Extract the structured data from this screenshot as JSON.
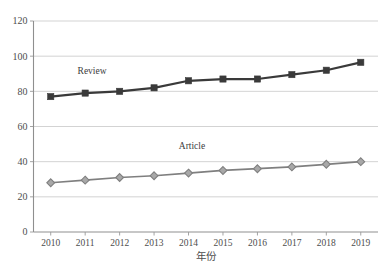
{
  "chart_data": {
    "type": "line",
    "title": "",
    "xlabel": "年份",
    "ylabel": "",
    "categories": [
      "2010",
      "2011",
      "2012",
      "2013",
      "2014",
      "2015",
      "2016",
      "2017",
      "2018",
      "2019"
    ],
    "x": [
      2010,
      2011,
      2012,
      2013,
      2014,
      2015,
      2016,
      2017,
      2018,
      2019
    ],
    "ylim": [
      0,
      120
    ],
    "y_ticks": [
      0,
      20,
      40,
      60,
      80,
      100,
      120
    ],
    "grid": "horizontal",
    "legend_position": "inline-labels",
    "series": [
      {
        "name": "Review",
        "marker": "square",
        "color": "#3a3a3a",
        "values": [
          77,
          79,
          80,
          82,
          86,
          87,
          87,
          89.5,
          92,
          96.5
        ]
      },
      {
        "name": "Article",
        "marker": "diamond",
        "color": "#7f7f7f",
        "values": [
          28,
          29.5,
          31,
          32,
          33.5,
          35,
          36,
          37,
          38.5,
          40
        ]
      }
    ],
    "annotations": [
      {
        "text": "Review",
        "x": 2011.2,
        "y": 90
      },
      {
        "text": "Article",
        "x": 2014.1,
        "y": 47
      }
    ]
  },
  "axes": {
    "y_tick_labels": [
      "120",
      "100",
      "80",
      "60",
      "40",
      "20",
      "0"
    ],
    "x_tick_labels": [
      "2010",
      "2011",
      "2012",
      "2013",
      "2014",
      "2015",
      "2016",
      "2017",
      "2018",
      "2019"
    ],
    "x_axis_title": "年份"
  },
  "colors": {
    "review": "#3a3a3a",
    "article": "#7f7f7f",
    "grid": "#c8c8c8",
    "axis": "#9a9a9a",
    "background": "#ffffff"
  },
  "caption": {
    "text": ""
  }
}
